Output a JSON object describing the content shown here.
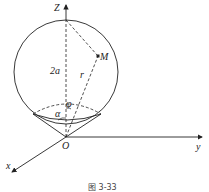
{
  "figure": {
    "caption": "图 3-33",
    "axes": {
      "z_label": "Z",
      "y_label": "y",
      "x_label": "x",
      "origin_label": "O"
    },
    "labels": {
      "diameter": "2a",
      "radius_vector": "r",
      "point": "M",
      "polar_angle": "φ",
      "cone_angle": "α"
    },
    "colors": {
      "stroke": "#222222",
      "background": "#ffffff"
    }
  }
}
